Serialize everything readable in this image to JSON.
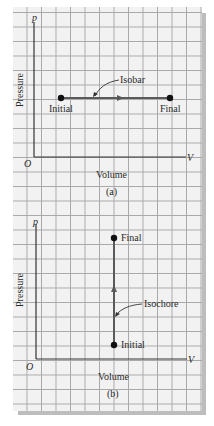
{
  "panels": [
    {
      "id": "a",
      "caption": "(a)",
      "y_axis_symbol": "p",
      "x_axis_symbol": "V",
      "origin_label": "O",
      "y_axis_label": "Pressure",
      "x_axis_label": "Volume",
      "process_label": "Isobar",
      "start_label": "Initial",
      "end_label": "Final"
    },
    {
      "id": "b",
      "caption": "(b)",
      "y_axis_symbol": "p",
      "x_axis_symbol": "V",
      "origin_label": "O",
      "y_axis_label": "Pressure",
      "x_axis_label": "Volume",
      "process_label": "Isochore",
      "start_label": "Initial",
      "end_label": "Final"
    }
  ],
  "colors": {
    "grid_paper": "#f2f2f2",
    "grid_line": "#a9a9a9",
    "axis": "#333333",
    "process_line": "#5a5a5a",
    "point": "#111111",
    "shadow": "#bdbdbd"
  }
}
